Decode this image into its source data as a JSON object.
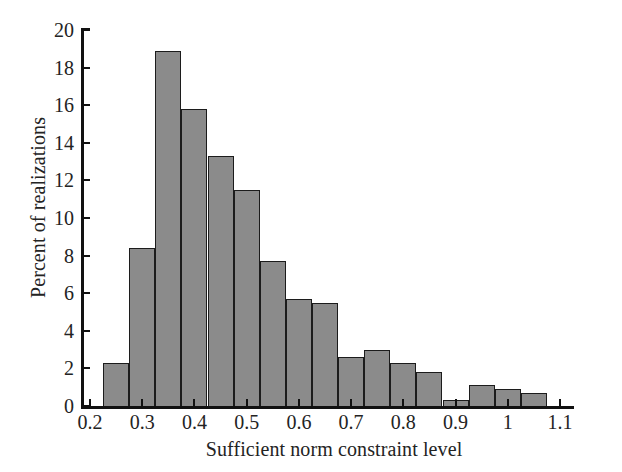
{
  "chart_data": {
    "type": "bar",
    "title": "",
    "subtitle": "",
    "xlabel": "Sufficient norm constraint level",
    "ylabel": "Percent of realizations",
    "xlim": [
      0.2,
      1.1
    ],
    "ylim": [
      0,
      20
    ],
    "grid": false,
    "legend": null,
    "bin_width": 0.05,
    "bar_color": "#8b8b8b",
    "bar_edge_color": "#1c1c1c",
    "xticks": [
      0.2,
      0.3,
      0.4,
      0.5,
      0.6,
      0.7,
      0.8,
      0.9,
      1.0,
      1.1
    ],
    "xtick_labels": [
      "0.2",
      "0.3",
      "0.4",
      "0.5",
      "0.6",
      "0.7",
      "0.8",
      "0.9",
      "1",
      "1.1"
    ],
    "yticks": [
      0,
      2,
      4,
      6,
      8,
      10,
      12,
      14,
      16,
      18,
      20
    ],
    "ytick_labels": [
      "0",
      "2",
      "4",
      "6",
      "8",
      "10",
      "12",
      "14",
      "16",
      "18",
      "20"
    ],
    "bins": [
      {
        "x0": 0.225,
        "x1": 0.275,
        "center": 0.25,
        "value": 2.3
      },
      {
        "x0": 0.275,
        "x1": 0.325,
        "center": 0.3,
        "value": 8.4
      },
      {
        "x0": 0.325,
        "x1": 0.375,
        "center": 0.35,
        "value": 18.9
      },
      {
        "x0": 0.375,
        "x1": 0.425,
        "center": 0.4,
        "value": 15.8
      },
      {
        "x0": 0.425,
        "x1": 0.475,
        "center": 0.45,
        "value": 13.3
      },
      {
        "x0": 0.475,
        "x1": 0.525,
        "center": 0.5,
        "value": 11.5
      },
      {
        "x0": 0.525,
        "x1": 0.575,
        "center": 0.55,
        "value": 7.7
      },
      {
        "x0": 0.575,
        "x1": 0.625,
        "center": 0.6,
        "value": 5.7
      },
      {
        "x0": 0.625,
        "x1": 0.675,
        "center": 0.65,
        "value": 5.5
      },
      {
        "x0": 0.675,
        "x1": 0.725,
        "center": 0.7,
        "value": 2.6
      },
      {
        "x0": 0.725,
        "x1": 0.775,
        "center": 0.75,
        "value": 3.0
      },
      {
        "x0": 0.775,
        "x1": 0.825,
        "center": 0.8,
        "value": 2.3
      },
      {
        "x0": 0.825,
        "x1": 0.875,
        "center": 0.85,
        "value": 1.8
      },
      {
        "x0": 0.875,
        "x1": 0.925,
        "center": 0.9,
        "value": 0.3
      },
      {
        "x0": 0.925,
        "x1": 0.975,
        "center": 0.95,
        "value": 1.1
      },
      {
        "x0": 0.975,
        "x1": 1.025,
        "center": 1.0,
        "value": 0.9
      },
      {
        "x0": 1.025,
        "x1": 1.075,
        "center": 1.05,
        "value": 0.7
      }
    ],
    "categories": [
      "0.25",
      "0.30",
      "0.35",
      "0.40",
      "0.45",
      "0.50",
      "0.55",
      "0.60",
      "0.65",
      "0.70",
      "0.75",
      "0.80",
      "0.85",
      "0.90",
      "0.95",
      "1.00",
      "1.05"
    ],
    "values": [
      2.3,
      8.4,
      18.9,
      15.8,
      13.3,
      11.5,
      7.7,
      5.7,
      5.5,
      2.6,
      3.0,
      2.3,
      1.8,
      0.3,
      1.1,
      0.9,
      0.7
    ]
  }
}
